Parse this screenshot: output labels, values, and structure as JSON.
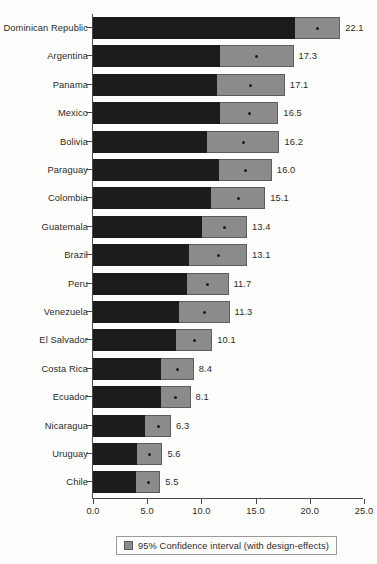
{
  "chart_data": {
    "type": "bar",
    "orientation": "horizontal",
    "title": "",
    "subtitle": "",
    "xlabel": "",
    "ylabel": "",
    "xlim": [
      0.0,
      25.0
    ],
    "xticks": [
      0.0,
      5.0,
      10.0,
      15.0,
      20.0,
      25.0
    ],
    "xtick_labels": [
      "0.0",
      "5.0",
      "10.0",
      "15.0",
      "20.0",
      "25.0"
    ],
    "grid": false,
    "legend_position": "bottom",
    "legend": [
      {
        "label": "95% Confidence interval (with design-effects)",
        "color": "#8b8b8b"
      }
    ],
    "value_format": "one-decimal",
    "categories": [
      "Dominican Republic",
      "Argentina",
      "Panama",
      "Mexico",
      "Bolivia",
      "Paraguay",
      "Colombia",
      "Guatemala",
      "Brazil",
      "Peru",
      "Venezuela",
      "El Salvador",
      "Costa Rica",
      "Ecuador",
      "Nicaragua",
      "Uruguay",
      "Chile"
    ],
    "values": [
      22.1,
      17.3,
      17.1,
      16.5,
      16.2,
      16.0,
      15.1,
      13.4,
      13.1,
      11.7,
      11.3,
      10.1,
      8.4,
      8.1,
      6.3,
      5.6,
      5.5
    ],
    "value_labels": [
      "22.1",
      "17.3",
      "17.1",
      "16.5",
      "16.2",
      "16.0",
      "15.1",
      "13.4",
      "13.1",
      "11.7",
      "11.3",
      "10.1",
      "8.4",
      "8.1",
      "6.3",
      "5.6",
      "5.5"
    ],
    "ci_lower": [
      18.6,
      11.7,
      11.4,
      11.7,
      10.5,
      11.6,
      10.9,
      10.1,
      8.9,
      8.7,
      7.9,
      7.7,
      6.3,
      6.3,
      4.8,
      4.1,
      4.0
    ],
    "ci_upper": [
      22.8,
      18.5,
      17.7,
      17.1,
      17.2,
      16.5,
      15.9,
      14.2,
      14.2,
      12.5,
      12.6,
      11.0,
      9.3,
      9.0,
      7.2,
      6.4,
      6.2
    ],
    "series": [
      {
        "name": "Point estimate",
        "color": "#1c1c1c"
      },
      {
        "name": "95% Confidence interval (with design-effects)",
        "color": "#8b8b8b"
      }
    ]
  },
  "axis": {
    "x_origin_px": 92,
    "px_per_unit": 10.84
  },
  "legend": {
    "label": "95% Confidence interval (with design-effects)",
    "swatch_color": "#8b8b8b"
  },
  "colors": {
    "estimate_bar": "#1c1c1c",
    "ci_box": "#8b8b8b",
    "ci_border": "#5d5d5d",
    "axis": "#4a4a4a",
    "text": "#2b2b2b",
    "background": "#fdfdfb"
  }
}
